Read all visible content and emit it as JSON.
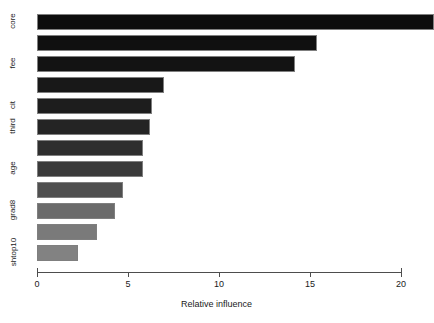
{
  "chart_data": {
    "type": "bar",
    "orientation": "horizontal",
    "title": "",
    "subtitle": "",
    "xlabel": "Relative influence",
    "ylabel": "",
    "xlim": [
      0,
      21.8
    ],
    "xticks": [
      0,
      5,
      10,
      15,
      20
    ],
    "xticklabels": [
      "0",
      "5",
      "10",
      "15",
      "20"
    ],
    "grid": false,
    "legend": null,
    "categories": [
      "core",
      "",
      "fee",
      "",
      "cit",
      "third",
      "",
      "age",
      "",
      "grad8",
      "",
      "shtop10"
    ],
    "visible_ytick_labels": [
      "core",
      "fee",
      "cit",
      "third",
      "age",
      "grad8",
      "shtop10"
    ],
    "values": [
      21.8,
      15.4,
      14.2,
      7.0,
      6.3,
      6.2,
      5.8,
      5.8,
      4.7,
      4.3,
      3.3,
      2.25
    ],
    "bar_colors": [
      "#0d0d0d",
      "#101010",
      "#131313",
      "#181818",
      "#1d1d1d",
      "#242424",
      "#2e2e2e",
      "#3a3a3a",
      "#4f4f4f",
      "#6b6b6b",
      "#7a7a7a",
      "#828282"
    ],
    "bar_border_color": "#7f7f7f",
    "axis_color": "#4d4d4d",
    "background": "#ffffff"
  },
  "axis": {
    "xlabel_text": "Relative influence"
  }
}
